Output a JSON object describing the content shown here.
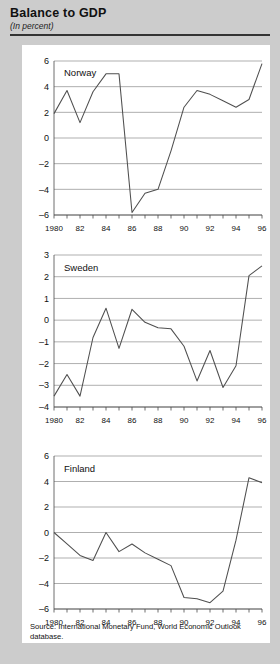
{
  "header": {
    "title": "Balance to GDP",
    "subtitle": "(In percent)"
  },
  "source": {
    "text": "Source:  International Monetary Fund, World Economic Outlook database."
  },
  "colors": {
    "page_background": "#cccccc",
    "panel_background": "#ffffff",
    "gridline": "#8c8c8c",
    "axis": "#4a4a4a",
    "data_line": "#4f4f4f",
    "text": "#111111"
  },
  "chart_data": [
    {
      "type": "line",
      "title": "Norway",
      "xlabel": "",
      "ylabel": "",
      "grid": true,
      "legend_position": "inside-top-left",
      "x": [
        1980,
        1981,
        1982,
        1983,
        1984,
        1985,
        1986,
        1987,
        1988,
        1989,
        1990,
        1991,
        1992,
        1993,
        1994,
        1995,
        1996
      ],
      "xlim": [
        1980,
        1996
      ],
      "ylim": [
        -6,
        6
      ],
      "yticks": [
        6,
        4,
        2,
        0,
        -2,
        -4,
        -6
      ],
      "ytick_labels": [
        "6",
        "4",
        "2",
        "0",
        "–2",
        "–4",
        "–6"
      ],
      "xtick_labels": [
        "1980",
        "82",
        "84",
        "86",
        "88",
        "90",
        "92",
        "94",
        "96"
      ],
      "xtick_values": [
        1980,
        1982,
        1984,
        1986,
        1988,
        1990,
        1992,
        1994,
        1996
      ],
      "series": [
        {
          "name": "Norway",
          "values": [
            1.9,
            3.7,
            1.2,
            3.6,
            5.0,
            5.0,
            -5.8,
            -4.3,
            -4.0,
            -1.0,
            2.4,
            3.7,
            3.4,
            2.9,
            2.4,
            3.0,
            5.8
          ]
        }
      ]
    },
    {
      "type": "line",
      "title": "Sweden",
      "xlabel": "",
      "ylabel": "",
      "grid": true,
      "legend_position": "inside-top-left",
      "x": [
        1980,
        1981,
        1982,
        1983,
        1984,
        1985,
        1986,
        1987,
        1988,
        1989,
        1990,
        1991,
        1992,
        1993,
        1994,
        1995,
        1996
      ],
      "xlim": [
        1980,
        1996
      ],
      "ylim": [
        -4,
        3
      ],
      "yticks": [
        3,
        2,
        1,
        0,
        -1,
        -2,
        -3,
        -4
      ],
      "ytick_labels": [
        "3",
        "2",
        "1",
        "0",
        "–1",
        "–2",
        "–3",
        "–4"
      ],
      "xtick_labels": [
        "1980",
        "82",
        "84",
        "86",
        "88",
        "90",
        "92",
        "94",
        "96"
      ],
      "xtick_values": [
        1980,
        1982,
        1984,
        1986,
        1988,
        1990,
        1992,
        1994,
        1996
      ],
      "series": [
        {
          "name": "Sweden",
          "values": [
            -3.5,
            -2.5,
            -3.5,
            -0.8,
            0.55,
            -1.3,
            0.5,
            -0.1,
            -0.35,
            -0.4,
            -1.2,
            -2.8,
            -1.4,
            -3.1,
            -2.1,
            2.05,
            2.5
          ]
        }
      ]
    },
    {
      "type": "line",
      "title": "Finland",
      "xlabel": "",
      "ylabel": "",
      "grid": true,
      "legend_position": "inside-top-left",
      "x": [
        1980,
        1981,
        1982,
        1983,
        1984,
        1985,
        1986,
        1987,
        1988,
        1989,
        1990,
        1991,
        1992,
        1993,
        1994,
        1995,
        1996
      ],
      "xlim": [
        1980,
        1996
      ],
      "ylim": [
        -6,
        6
      ],
      "yticks": [
        6,
        4,
        2,
        0,
        -2,
        -4,
        -6
      ],
      "ytick_labels": [
        "6",
        "4",
        "2",
        "0",
        "–2",
        "–4",
        "–6"
      ],
      "xtick_labels": [
        "1980",
        "82",
        "84",
        "86",
        "88",
        "90",
        "92",
        "94",
        "96"
      ],
      "xtick_values": [
        1980,
        1982,
        1984,
        1986,
        1988,
        1990,
        1992,
        1994,
        1996
      ],
      "series": [
        {
          "name": "Finland",
          "values": [
            0.0,
            -0.9,
            -1.8,
            -2.2,
            0.0,
            -1.5,
            -0.9,
            -1.6,
            -2.1,
            -2.6,
            -5.1,
            -5.2,
            -5.5,
            -4.6,
            -0.6,
            4.3,
            3.9
          ]
        }
      ]
    }
  ]
}
